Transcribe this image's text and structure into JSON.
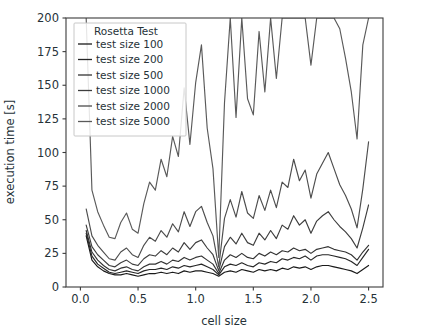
{
  "chart_data": {
    "type": "line",
    "title": "",
    "xlabel": "cell size",
    "ylabel": "execution time [s]",
    "xlim": [
      -0.125,
      2.625
    ],
    "ylim": [
      0,
      200
    ],
    "xticks": [
      "0.0",
      "0.5",
      "1.0",
      "1.5",
      "2.0",
      "2.5"
    ],
    "xtick_values": [
      0.0,
      0.5,
      1.0,
      1.5,
      2.0,
      2.5
    ],
    "yticks": [
      "0",
      "25",
      "50",
      "75",
      "100",
      "125",
      "150",
      "175",
      "200"
    ],
    "ytick_values": [
      0,
      25,
      50,
      75,
      100,
      125,
      150,
      175,
      200
    ],
    "grid": false,
    "legend": {
      "title": "Rosetta Test",
      "position": "upper left",
      "entries": [
        {
          "label": "test size 100",
          "color": "#1a1a1a"
        },
        {
          "label": "test size 200",
          "color": "#262626"
        },
        {
          "label": "test size 500",
          "color": "#333333"
        },
        {
          "label": "test size 1000",
          "color": "#3d3d3d"
        },
        {
          "label": "test size 2000",
          "color": "#4d4d4d"
        },
        {
          "label": "test size 5000",
          "color": "#5a5a5a"
        }
      ]
    },
    "x": [
      0.05,
      0.1,
      0.15,
      0.2,
      0.25,
      0.3,
      0.35,
      0.4,
      0.45,
      0.5,
      0.55,
      0.6,
      0.65,
      0.7,
      0.75,
      0.8,
      0.85,
      0.9,
      0.95,
      1.0,
      1.05,
      1.1,
      1.15,
      1.2,
      1.25,
      1.3,
      1.35,
      1.4,
      1.45,
      1.5,
      1.55,
      1.6,
      1.65,
      1.7,
      1.75,
      1.8,
      1.85,
      1.9,
      1.95,
      2.0,
      2.05,
      2.1,
      2.15,
      2.2,
      2.25,
      2.3,
      2.35,
      2.4,
      2.45,
      2.5
    ],
    "series": [
      {
        "name": "test size 100",
        "color": "#1a1a1a",
        "values": [
          38,
          20,
          15,
          12,
          10,
          9,
          9,
          10,
          9,
          8,
          9,
          10,
          10,
          11,
          10,
          11,
          10,
          12,
          11,
          12,
          12,
          11,
          10,
          8,
          11,
          12,
          11,
          13,
          12,
          11,
          13,
          12,
          13,
          12,
          14,
          13,
          15,
          14,
          15,
          13,
          15,
          16,
          16,
          15,
          14,
          13,
          12,
          10,
          13,
          16
        ]
      },
      {
        "name": "test size 200",
        "color": "#262626",
        "values": [
          40,
          23,
          17,
          14,
          11,
          10,
          11,
          12,
          11,
          10,
          12,
          13,
          13,
          14,
          13,
          15,
          14,
          16,
          15,
          16,
          17,
          15,
          13,
          9,
          15,
          17,
          16,
          18,
          16,
          15,
          18,
          17,
          19,
          18,
          21,
          20,
          22,
          21,
          23,
          20,
          23,
          24,
          24,
          23,
          22,
          21,
          19,
          16,
          22,
          28
        ]
      },
      {
        "name": "test size 500",
        "color": "#333333",
        "values": [
          42,
          26,
          20,
          16,
          13,
          12,
          14,
          15,
          13,
          12,
          15,
          17,
          17,
          19,
          17,
          20,
          19,
          22,
          20,
          22,
          23,
          20,
          17,
          10,
          20,
          24,
          22,
          25,
          22,
          21,
          25,
          23,
          26,
          24,
          27,
          26,
          29,
          27,
          28,
          25,
          28,
          29,
          30,
          28,
          27,
          26,
          24,
          20,
          26,
          31
        ]
      },
      {
        "name": "test size 1000",
        "color": "#3d3d3d",
        "values": [
          46,
          30,
          24,
          20,
          16,
          15,
          18,
          20,
          17,
          16,
          21,
          24,
          23,
          27,
          24,
          29,
          26,
          33,
          28,
          33,
          35,
          29,
          24,
          12,
          30,
          37,
          32,
          40,
          33,
          31,
          40,
          35,
          42,
          36,
          46,
          43,
          53,
          46,
          50,
          40,
          49,
          53,
          56,
          50,
          45,
          41,
          36,
          29,
          44,
          61
        ]
      },
      {
        "name": "test size 2000",
        "color": "#4d4d4d",
        "values": [
          58,
          38,
          31,
          26,
          21,
          20,
          26,
          29,
          24,
          22,
          31,
          37,
          34,
          42,
          37,
          47,
          41,
          56,
          45,
          56,
          60,
          48,
          38,
          15,
          51,
          65,
          52,
          71,
          55,
          51,
          68,
          57,
          72,
          59,
          78,
          74,
          95,
          79,
          87,
          66,
          84,
          92,
          100,
          88,
          76,
          68,
          58,
          44,
          73,
          108
        ]
      },
      {
        "name": "test size 5000",
        "color": "#5a5a5a",
        "values": [
          200,
          72,
          56,
          46,
          37,
          36,
          48,
          55,
          43,
          40,
          62,
          78,
          72,
          95,
          82,
          112,
          97,
          148,
          106,
          152,
          180,
          118,
          88,
          22,
          137,
          200,
          126,
          200,
          140,
          128,
          190,
          145,
          200,
          155,
          200,
          200,
          200,
          200,
          200,
          165,
          200,
          200,
          200,
          200,
          192,
          170,
          145,
          110,
          180,
          200
        ]
      }
    ]
  }
}
